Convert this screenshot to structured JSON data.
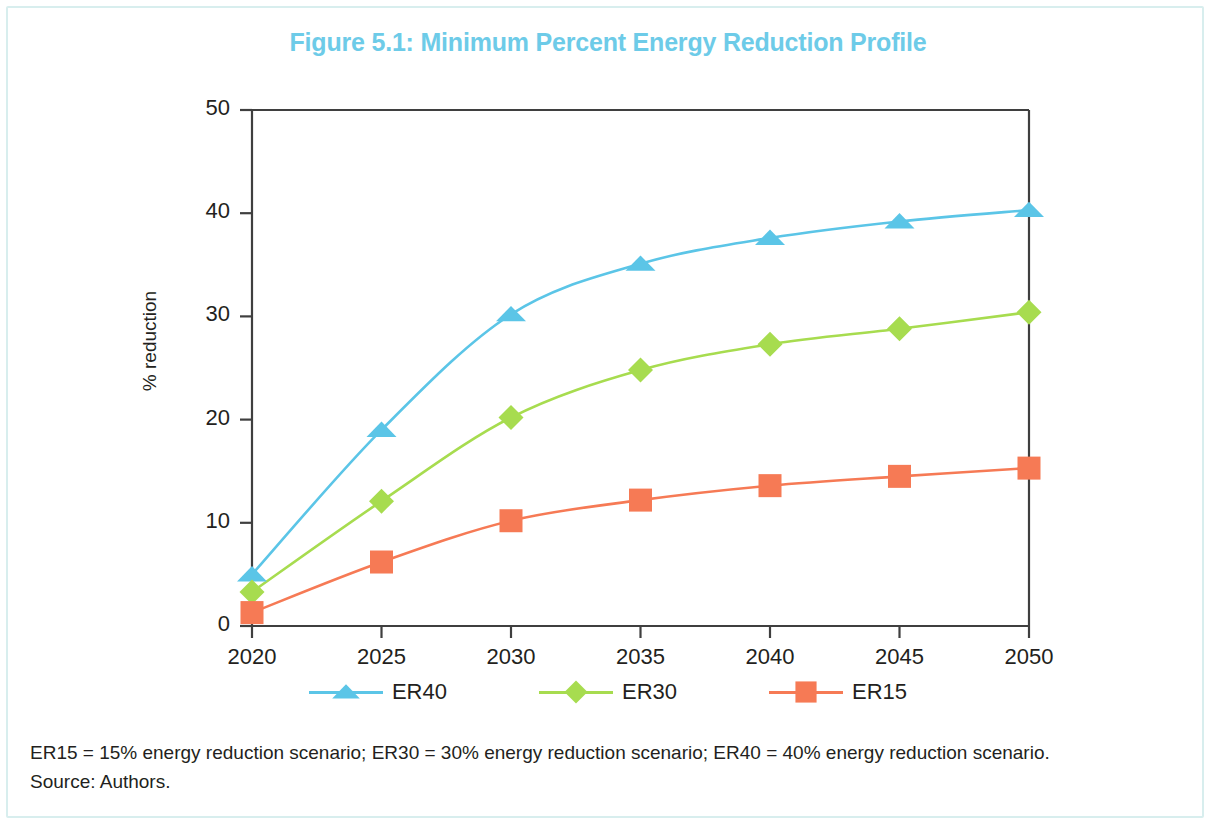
{
  "figure": {
    "title": "Figure 5.1: Minimum Percent Energy Reduction Profile",
    "title_color": "#6dcbe8"
  },
  "notes": {
    "definitions": "ER15 = 15% energy reduction scenario; ER30 = 30% energy reduction scenario; ER40 = 40% energy reduction scenario.",
    "source": "Source: Authors."
  },
  "axes": {
    "y_label": "% reduction",
    "y_ticks": [
      "0",
      "10",
      "20",
      "30",
      "40",
      "50"
    ],
    "x_ticks": [
      "2020",
      "2025",
      "2030",
      "2035",
      "2040",
      "2045",
      "2050"
    ]
  },
  "legend": {
    "items": [
      {
        "label": "ER40",
        "color": "#5bc5e7",
        "marker": "triangle"
      },
      {
        "label": "ER30",
        "color": "#a7dc4f",
        "marker": "diamond"
      },
      {
        "label": "ER15",
        "color": "#f67a55",
        "marker": "square"
      }
    ]
  },
  "chart_data": {
    "type": "line",
    "title": "Figure 5.1: Minimum Percent Energy Reduction Profile",
    "xlabel": "",
    "ylabel": "% reduction",
    "x": [
      2020,
      2025,
      2030,
      2035,
      2040,
      2045,
      2050
    ],
    "xlim": [
      2020,
      2050
    ],
    "ylim": [
      0,
      50
    ],
    "yticks": [
      0,
      10,
      20,
      30,
      40,
      50
    ],
    "xticks": [
      2020,
      2025,
      2030,
      2035,
      2040,
      2045,
      2050
    ],
    "grid": false,
    "legend_position": "bottom",
    "series": [
      {
        "name": "ER40",
        "color": "#5bc5e7",
        "marker": "triangle",
        "values": [
          5.0,
          19.0,
          30.2,
          35.1,
          37.6,
          39.2,
          40.3
        ]
      },
      {
        "name": "ER30",
        "color": "#a7dc4f",
        "marker": "diamond",
        "values": [
          3.3,
          12.1,
          20.2,
          24.8,
          27.3,
          28.8,
          30.4
        ]
      },
      {
        "name": "ER15",
        "color": "#f67a55",
        "marker": "square",
        "values": [
          1.3,
          6.2,
          10.2,
          12.2,
          13.6,
          14.5,
          15.3
        ]
      }
    ]
  }
}
